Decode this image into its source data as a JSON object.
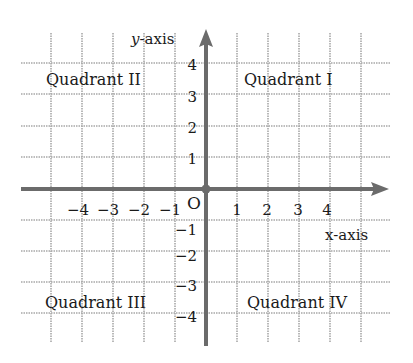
{
  "diagram": {
    "type": "coordinate-plane",
    "axes": {
      "x_label": "x-axis",
      "y_label_var": "y",
      "y_label_suffix": "-axis",
      "origin_label": "O"
    },
    "x_ticks": [
      {
        "value": -4,
        "label": "−4"
      },
      {
        "value": -3,
        "label": "−3"
      },
      {
        "value": -2,
        "label": "−2"
      },
      {
        "value": -1,
        "label": "−1"
      },
      {
        "value": 1,
        "label": "1"
      },
      {
        "value": 2,
        "label": "2"
      },
      {
        "value": 3,
        "label": "3"
      },
      {
        "value": 4,
        "label": "4"
      }
    ],
    "y_ticks": [
      {
        "value": 4,
        "label": "4"
      },
      {
        "value": 3,
        "label": "3"
      },
      {
        "value": 2,
        "label": "2"
      },
      {
        "value": 1,
        "label": "1"
      },
      {
        "value": -1,
        "label": "−1"
      },
      {
        "value": -2,
        "label": "−2"
      },
      {
        "value": -3,
        "label": "−3"
      },
      {
        "value": -4,
        "label": "−4"
      }
    ],
    "quadrants": {
      "q1": "Quadrant I",
      "q2": "Quadrant II",
      "q3": "Quadrant III",
      "q4": "Quadrant IV"
    },
    "colors": {
      "axis": "#6b6b6b",
      "grid": "#a8a8a8",
      "text": "#1a1a1a"
    }
  }
}
